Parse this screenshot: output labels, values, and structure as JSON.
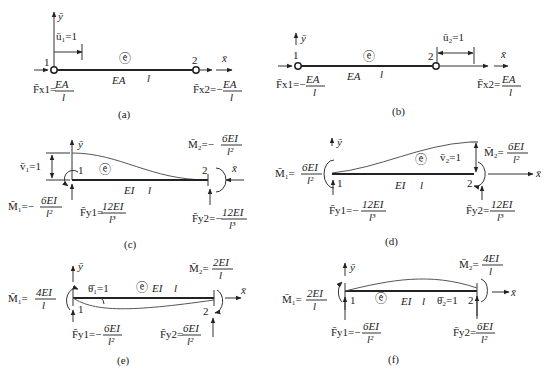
{
  "figure": {
    "panels": [
      {
        "id": "a",
        "caption": "(a)",
        "element_symbol": "ⓔ",
        "property": "EA",
        "length": "l",
        "node1": "1",
        "node2": "2",
        "axis_x": "x̄",
        "axis_y": "ȳ",
        "displacement": "ū₁=1",
        "force1_label": "F̄x1=",
        "force1_num": "EA",
        "force1_den": "l",
        "force2_label": "F̄x2=−",
        "force2_num": "EA",
        "force2_den": "l"
      },
      {
        "id": "b",
        "caption": "(b)",
        "element_symbol": "ⓔ",
        "property": "EA",
        "length": "l",
        "node1": "1",
        "node2": "2",
        "axis_x": "x̄",
        "axis_y": "ȳ",
        "displacement": "ū₂=1",
        "force1_label": "F̄x1=−",
        "force1_num": "EA",
        "force1_den": "l",
        "force2_label": "F̄x2=",
        "force2_num": "EA",
        "force2_den": "l"
      },
      {
        "id": "c",
        "caption": "(c)",
        "element_symbol": "ⓔ",
        "property": "EI",
        "length": "l",
        "node1": "1",
        "node2": "2",
        "axis_x": "x̄",
        "axis_y": "ȳ",
        "displacement": "v̄₁=1",
        "moment1_label": "M̄₁=−",
        "moment1_num": "6EI",
        "moment1_den": "l²",
        "moment2_label": "M̄₂=−",
        "moment2_num": "6EI",
        "moment2_den": "l²",
        "force1_label": "F̄y1=",
        "force1_num": "12EI",
        "force1_den": "l³",
        "force2_label": "F̄y2=−",
        "force2_num": "12EI",
        "force2_den": "l³"
      },
      {
        "id": "d",
        "caption": "(d)",
        "element_symbol": "ⓔ",
        "property": "EI",
        "length": "l",
        "node1": "1",
        "node2": "2",
        "axis_x": "x̄",
        "axis_y": "ȳ",
        "displacement": "v̄₂=1",
        "moment1_label": "M̄₁=",
        "moment1_num": "6EI",
        "moment1_den": "l²",
        "moment2_label": "M̄₂=",
        "moment2_num": "6EI",
        "moment2_den": "l²",
        "force1_label": "F̄y1=−",
        "force1_num": "12EI",
        "force1_den": "l³",
        "force2_label": "F̄y2=",
        "force2_num": "12EI",
        "force2_den": "l³"
      },
      {
        "id": "e",
        "caption": "(e)",
        "element_symbol": "ⓔ",
        "property": "EI",
        "length": "l",
        "node1": "1",
        "node2": "2",
        "axis_x": "x̄",
        "axis_y": "ȳ",
        "displacement": "θ̄₁=1",
        "moment1_label": "M̄₁=",
        "moment1_num": "4EI",
        "moment1_den": "l",
        "moment2_label": "M̄₂=",
        "moment2_num": "2EI",
        "moment2_den": "l",
        "force1_label": "F̄y1=−",
        "force1_num": "6EI",
        "force1_den": "l²",
        "force2_label": "F̄y2=",
        "force2_num": "6EI",
        "force2_den": "l²"
      },
      {
        "id": "f",
        "caption": "(f)",
        "element_symbol": "ⓔ",
        "property": "EI",
        "length": "l",
        "node1": "1",
        "node2": "2",
        "axis_x": "x̄",
        "axis_y": "ȳ",
        "displacement": "θ̄₂=1",
        "moment1_label": "M̄₁=",
        "moment1_num": "2EI",
        "moment1_den": "l",
        "moment2_label": "M̄₂=",
        "moment2_num": "4EI",
        "moment2_den": "l",
        "force1_label": "F̄y1=−",
        "force1_num": "6EI",
        "force1_den": "l²",
        "force2_label": "F̄y2=",
        "force2_num": "6EI",
        "force2_den": "l²"
      }
    ]
  }
}
